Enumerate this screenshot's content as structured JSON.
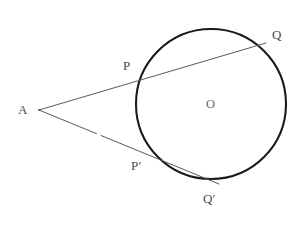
{
  "figure": {
    "background_color": "#ffffff",
    "width": 301,
    "height": 226
  },
  "circle": {
    "name": "circle-O",
    "cx": 211,
    "cy": 104,
    "r": 75,
    "stroke_color": "#1a1a1a",
    "stroke_width": 2.1,
    "fill": "none"
  },
  "points": {
    "A": {
      "label": "A",
      "x": 39,
      "y": 110,
      "label_x": 18,
      "label_y": 103
    },
    "P": {
      "label": "P",
      "x": 142,
      "y": 72,
      "label_x": 123,
      "label_y": 59
    },
    "Q": {
      "label": "Q",
      "x": 266,
      "y": 43,
      "label_x": 272,
      "label_y": 28
    },
    "Pprime": {
      "label": "P′",
      "x": 149,
      "y": 152,
      "label_x": 131,
      "label_y": 159
    },
    "Qprime": {
      "label": "Q′",
      "x": 219,
      "y": 184,
      "label_x": 203,
      "label_y": 192
    },
    "O": {
      "label": "O",
      "x": 211,
      "y": 104,
      "label_x": 206,
      "label_y": 98
    }
  },
  "secants": [
    {
      "name": "secant-APQ",
      "from": "A",
      "through": "P",
      "to": "Q",
      "x1": 39,
      "y1": 110,
      "x2": 266,
      "y2": 43,
      "stroke_color": "#5a5a5a",
      "stroke_width": 1.0,
      "dashed": false
    },
    {
      "name": "secant-APprimeQprime",
      "from": "A",
      "through": "P′",
      "to": "Q′",
      "x1": 39,
      "y1": 110,
      "x2": 219,
      "y2": 184,
      "stroke_color": "#5a5a5a",
      "stroke_width": 1.0,
      "dashed": true,
      "dash_pattern": "62 5 200"
    }
  ],
  "colors": {
    "ink": "#1a1a1a",
    "line": "#5a5a5a",
    "label": "#4a4a4a",
    "faint": "#f2f2f2"
  },
  "caption": {
    "text": ""
  }
}
